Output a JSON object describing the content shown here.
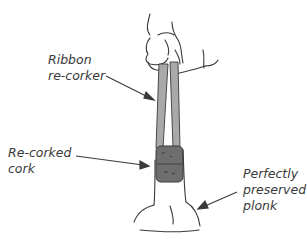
{
  "labels": {
    "ribbon": [
      "Ribbon",
      "re-corker"
    ],
    "cork": [
      "Re-corked",
      "cork"
    ],
    "plonk": [
      "Perfectly",
      "preserved",
      "plonk"
    ]
  },
  "colors": {
    "ink": "#3a3a3a",
    "ribbon": "#a9a9a9",
    "cork": "#6e6e6e"
  }
}
